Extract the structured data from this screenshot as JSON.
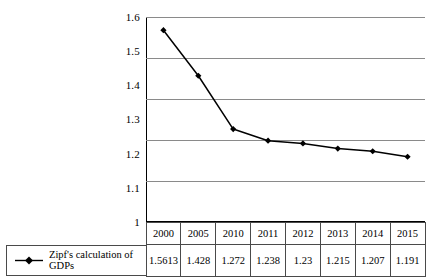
{
  "chart_data": {
    "type": "line",
    "title": "",
    "xlabel": "",
    "ylabel": "",
    "categories": [
      "2000",
      "2005",
      "2010",
      "2011",
      "2012",
      "2013",
      "2014",
      "2015"
    ],
    "series": [
      {
        "name": "Zipf's calculation of GDPs",
        "values": [
          1.5613,
          1.428,
          1.272,
          1.238,
          1.23,
          1.215,
          1.207,
          1.191
        ],
        "marker": "diamond",
        "color": "#000000"
      }
    ],
    "ylim": [
      1,
      1.6
    ],
    "ytick_labels": [
      "1.6",
      "1.5",
      "1.4",
      "1.3",
      "1.2",
      "1.1",
      "1"
    ],
    "grid": true,
    "grid_color": "#8a8a8a",
    "legend_position": "bottom-left",
    "has_data_table": true
  },
  "axis": {
    "y_ticks": [
      {
        "label": "1.6"
      },
      {
        "label": "1.5"
      },
      {
        "label": "1.4"
      },
      {
        "label": "1.3"
      },
      {
        "label": "1.2"
      },
      {
        "label": "1.1"
      },
      {
        "label": "1"
      }
    ]
  },
  "legend": {
    "series_label": "Zipf's calculation of GDPs"
  },
  "table": {
    "header": [
      "2000",
      "2005",
      "2010",
      "2011",
      "2012",
      "2013",
      "2014",
      "2015"
    ],
    "values": [
      "1.5613",
      "1.428",
      "1.272",
      "1.238",
      "1.23",
      "1.215",
      "1.207",
      "1.191"
    ]
  },
  "colors": {
    "line": "#000000",
    "grid": "#8a8a8a",
    "border": "#4a4a4a",
    "background": "#ffffff"
  }
}
